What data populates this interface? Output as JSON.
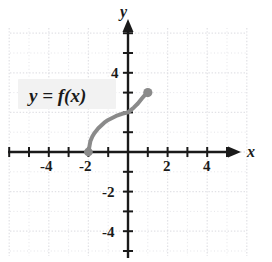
{
  "figure": {
    "title": "",
    "background_color": "#ffffff",
    "grid_color": "#e2e2e6",
    "axis_color": "#1a1a1a",
    "curve_color": "#8a8a8a"
  },
  "axes": {
    "x_axis_name": "x",
    "y_axis_name": "y",
    "x_tick_labels": [
      "-4",
      "-2",
      "2",
      "4"
    ],
    "y_tick_labels": [
      "4",
      "-2",
      "-4"
    ],
    "x_arrow": "right-arrow",
    "y_arrow": "up-arrow"
  },
  "annotations": {
    "function_label": "y = f(x)"
  },
  "chart_data": {
    "type": "line",
    "title": "",
    "xlabel": "x",
    "ylabel": "y",
    "xlim": [
      -6,
      6
    ],
    "ylim": [
      -6,
      6
    ],
    "xticks": [
      -6,
      -5,
      -4,
      -3,
      -2,
      -1,
      1,
      2,
      3,
      4,
      5,
      6
    ],
    "yticks": [
      -6,
      -5,
      -4,
      -3,
      -2,
      -1,
      1,
      2,
      3,
      4,
      5,
      6
    ],
    "xtick_labels": {
      "-4": "-4",
      "-2": "-2",
      "2": "2",
      "4": "4"
    },
    "ytick_labels": {
      "4": "4",
      "-2": "-2",
      "-4": "-4"
    },
    "grid": true,
    "legend": "none",
    "series": [
      {
        "name": "y = f(x)",
        "color": "#8a8a8a",
        "line_width": 4,
        "domain": [
          -2,
          1
        ],
        "endpoints": [
          {
            "x": -2,
            "y": 0,
            "marker": "filled-circle"
          },
          {
            "x": 1,
            "y": 3,
            "marker": "filled-circle"
          }
        ],
        "points": [
          {
            "x": -2.0,
            "y": 0.0
          },
          {
            "x": -1.9,
            "y": 0.55
          },
          {
            "x": -1.8,
            "y": 0.78
          },
          {
            "x": -1.7,
            "y": 0.95
          },
          {
            "x": -1.5,
            "y": 1.2
          },
          {
            "x": -1.2,
            "y": 1.48
          },
          {
            "x": -1.0,
            "y": 1.62
          },
          {
            "x": -0.6,
            "y": 1.82
          },
          {
            "x": -0.3,
            "y": 1.93
          },
          {
            "x": 0.0,
            "y": 2.0
          },
          {
            "x": 0.3,
            "y": 2.25
          },
          {
            "x": 0.5,
            "y": 2.45
          },
          {
            "x": 0.7,
            "y": 2.7
          },
          {
            "x": 0.85,
            "y": 2.87
          },
          {
            "x": 1.0,
            "y": 3.0
          }
        ]
      }
    ]
  }
}
